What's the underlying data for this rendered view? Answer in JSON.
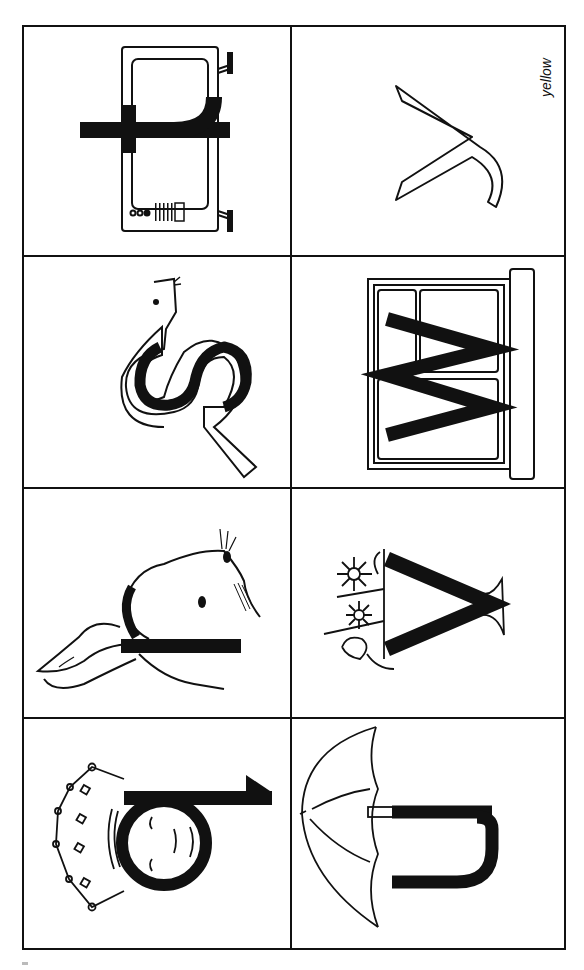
{
  "worksheet": {
    "orientation": "rotated-90-clockwise",
    "cells": [
      {
        "row": 0,
        "col": 0,
        "letter": "t",
        "picture": "television"
      },
      {
        "row": 0,
        "col": 1,
        "letter": "y",
        "picture": "outline-letter",
        "caption": "yellow"
      },
      {
        "row": 1,
        "col": 0,
        "letter": "s",
        "picture": "snake"
      },
      {
        "row": 1,
        "col": 1,
        "letter": "w",
        "picture": "window"
      },
      {
        "row": 2,
        "col": 0,
        "letter": "l",
        "picture": "rabbit"
      },
      {
        "row": 2,
        "col": 1,
        "letter": "v",
        "picture": "vase-with-flowers"
      },
      {
        "row": 3,
        "col": 0,
        "letter": "b",
        "picture": "queen"
      },
      {
        "row": 3,
        "col": 1,
        "letter": "u",
        "picture": "umbrella"
      }
    ]
  },
  "captions": {
    "yellow": "yellow"
  },
  "colors": {
    "ink": "#111111",
    "paper": "#ffffff"
  }
}
